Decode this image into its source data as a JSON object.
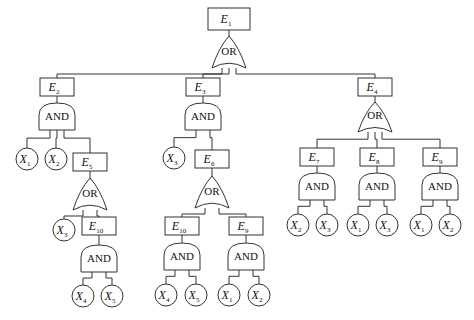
{
  "diagram": {
    "type": "fault-tree",
    "events": [
      {
        "id": "E1",
        "name": "E",
        "sub": "1",
        "x": 208,
        "y": 8,
        "w": 42,
        "h": 22
      },
      {
        "id": "E2",
        "name": "E",
        "sub": "2",
        "x": 40,
        "y": 78,
        "w": 34,
        "h": 18
      },
      {
        "id": "E3",
        "name": "E",
        "sub": "3",
        "x": 186,
        "y": 78,
        "w": 34,
        "h": 18
      },
      {
        "id": "E4",
        "name": "E",
        "sub": "4",
        "x": 358,
        "y": 78,
        "w": 34,
        "h": 18
      },
      {
        "id": "E5",
        "name": "E",
        "sub": "5",
        "x": 73,
        "y": 153,
        "w": 34,
        "h": 18
      },
      {
        "id": "E6",
        "name": "E",
        "sub": "6",
        "x": 195,
        "y": 150,
        "w": 34,
        "h": 18
      },
      {
        "id": "E10a",
        "name": "E",
        "sub": "10",
        "x": 82,
        "y": 217,
        "w": 34,
        "h": 18
      },
      {
        "id": "E7",
        "name": "E",
        "sub": "7",
        "x": 300,
        "y": 148,
        "w": 34,
        "h": 18
      },
      {
        "id": "E8",
        "name": "E",
        "sub": "8",
        "x": 360,
        "y": 148,
        "w": 34,
        "h": 18
      },
      {
        "id": "E9a",
        "name": "E",
        "sub": "9",
        "x": 423,
        "y": 148,
        "w": 34,
        "h": 18
      },
      {
        "id": "E10b",
        "name": "E",
        "sub": "10",
        "x": 165,
        "y": 217,
        "w": 34,
        "h": 18
      },
      {
        "id": "E9b",
        "name": "E",
        "sub": "9",
        "x": 229,
        "y": 217,
        "w": 34,
        "h": 18
      }
    ],
    "gates": [
      {
        "id": "G1",
        "type": "OR",
        "label": "OR",
        "cx": 229,
        "top": 36,
        "bottom": 68
      },
      {
        "id": "G2",
        "type": "AND",
        "label": "AND",
        "cx": 57,
        "top": 103,
        "bottom": 130
      },
      {
        "id": "G3",
        "type": "AND",
        "label": "AND",
        "cx": 203,
        "top": 103,
        "bottom": 130
      },
      {
        "id": "G4",
        "type": "OR",
        "label": "OR",
        "cx": 375,
        "top": 102,
        "bottom": 132
      },
      {
        "id": "G5",
        "type": "OR",
        "label": "OR",
        "cx": 90,
        "top": 178,
        "bottom": 210
      },
      {
        "id": "G6",
        "type": "OR",
        "label": "OR",
        "cx": 212,
        "top": 176,
        "bottom": 208
      },
      {
        "id": "G7",
        "type": "AND",
        "label": "AND",
        "cx": 99,
        "top": 245,
        "bottom": 272
      },
      {
        "id": "G8",
        "type": "AND",
        "label": "AND",
        "cx": 317,
        "top": 173,
        "bottom": 200
      },
      {
        "id": "G9",
        "type": "AND",
        "label": "AND",
        "cx": 377,
        "top": 173,
        "bottom": 200
      },
      {
        "id": "G10",
        "type": "AND",
        "label": "AND",
        "cx": 440,
        "top": 173,
        "bottom": 200
      },
      {
        "id": "G11",
        "type": "AND",
        "label": "AND",
        "cx": 182,
        "top": 243,
        "bottom": 270
      },
      {
        "id": "G12",
        "type": "AND",
        "label": "AND",
        "cx": 246,
        "top": 243,
        "bottom": 270
      }
    ],
    "basics": [
      {
        "id": "X1a",
        "name": "X",
        "sub": "1",
        "cx": 27,
        "cy": 159
      },
      {
        "id": "X2a",
        "name": "X",
        "sub": "2",
        "cx": 56,
        "cy": 159
      },
      {
        "id": "X3a",
        "name": "X",
        "sub": "3",
        "cx": 174,
        "cy": 158
      },
      {
        "id": "X3b",
        "name": "X",
        "sub": "3",
        "cx": 64,
        "cy": 230
      },
      {
        "id": "X4a",
        "name": "X",
        "sub": "4",
        "cx": 83,
        "cy": 296
      },
      {
        "id": "X5a",
        "name": "X",
        "sub": "5",
        "cx": 112,
        "cy": 296
      },
      {
        "id": "X4b",
        "name": "X",
        "sub": "4",
        "cx": 166,
        "cy": 295
      },
      {
        "id": "X5b",
        "name": "X",
        "sub": "5",
        "cx": 196,
        "cy": 295
      },
      {
        "id": "X1b",
        "name": "X",
        "sub": "1",
        "cx": 229,
        "cy": 295
      },
      {
        "id": "X2b",
        "name": "X",
        "sub": "2",
        "cx": 259,
        "cy": 295
      },
      {
        "id": "X2c",
        "name": "X",
        "sub": "2",
        "cx": 298,
        "cy": 225
      },
      {
        "id": "X3c",
        "name": "X",
        "sub": "3",
        "cx": 327,
        "cy": 225
      },
      {
        "id": "X1c",
        "name": "X",
        "sub": "1",
        "cx": 358,
        "cy": 225
      },
      {
        "id": "X3d",
        "name": "X",
        "sub": "3",
        "cx": 387,
        "cy": 225
      },
      {
        "id": "X1d",
        "name": "X",
        "sub": "1",
        "cx": 421,
        "cy": 225
      },
      {
        "id": "X2d",
        "name": "X",
        "sub": "2",
        "cx": 450,
        "cy": 225
      }
    ],
    "edges": [
      [
        "E1",
        "G1"
      ],
      [
        "G1",
        "E2"
      ],
      [
        "G1",
        "E3"
      ],
      [
        "G1",
        "E4"
      ],
      [
        "E2",
        "G2"
      ],
      [
        "G2",
        "X1a"
      ],
      [
        "G2",
        "X2a"
      ],
      [
        "G2",
        "E5"
      ],
      [
        "E5",
        "G5"
      ],
      [
        "G5",
        "X3b"
      ],
      [
        "G5",
        "E10a"
      ],
      [
        "E10a",
        "G7"
      ],
      [
        "G7",
        "X4a"
      ],
      [
        "G7",
        "X5a"
      ],
      [
        "E3",
        "G3"
      ],
      [
        "G3",
        "X3a"
      ],
      [
        "G3",
        "E6"
      ],
      [
        "E6",
        "G6"
      ],
      [
        "G6",
        "E10b"
      ],
      [
        "G6",
        "E9b"
      ],
      [
        "E10b",
        "G11"
      ],
      [
        "G11",
        "X4b"
      ],
      [
        "G11",
        "X5b"
      ],
      [
        "E9b",
        "G12"
      ],
      [
        "G12",
        "X1b"
      ],
      [
        "G12",
        "X2b"
      ],
      [
        "E4",
        "G4"
      ],
      [
        "G4",
        "E7"
      ],
      [
        "G4",
        "E8"
      ],
      [
        "G4",
        "E9a"
      ],
      [
        "E7",
        "G8"
      ],
      [
        "G8",
        "X2c"
      ],
      [
        "G8",
        "X3c"
      ],
      [
        "E8",
        "G9"
      ],
      [
        "G9",
        "X1c"
      ],
      [
        "G9",
        "X3d"
      ],
      [
        "E9a",
        "G10"
      ],
      [
        "G10",
        "X1d"
      ],
      [
        "G10",
        "X2d"
      ]
    ]
  },
  "colors": {
    "line": "#333333",
    "text": "#111111",
    "background": "#ffffff"
  }
}
